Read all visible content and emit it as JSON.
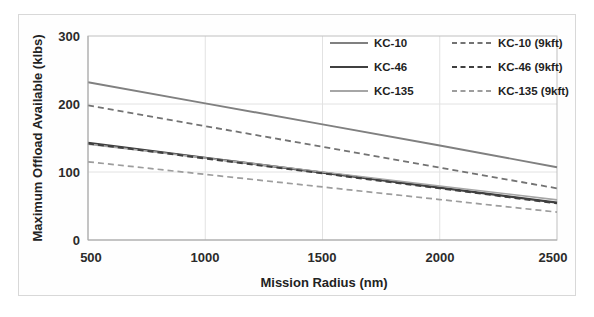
{
  "chart_data": {
    "type": "line",
    "title": "",
    "xlabel": "Mission Radius (nm)",
    "ylabel": "Maximum Offload Available (klbs)",
    "xlim": [
      500,
      2500
    ],
    "ylim": [
      0,
      300
    ],
    "xticks": [
      500,
      1000,
      1500,
      2000,
      2500
    ],
    "yticks": [
      0,
      100,
      200,
      300
    ],
    "xtick_labels": [
      "500",
      "1000",
      "1500",
      "2000",
      "2500"
    ],
    "ytick_labels": [
      "0",
      "100",
      "200",
      "300"
    ],
    "grid": "horizontal-and-vertical-light",
    "legend_position": "upper-right-inside-two-columns",
    "x": [
      500,
      1000,
      1500,
      2000,
      2500
    ],
    "series": [
      {
        "name": "KC-10",
        "style": "solid",
        "color": "#808080",
        "width": 1.9,
        "values": [
          232,
          201,
          170,
          139,
          107
        ]
      },
      {
        "name": "KC-46",
        "style": "solid",
        "color": "#404040",
        "width": 2.2,
        "values": [
          143,
          121,
          99,
          77,
          55
        ]
      },
      {
        "name": "KC-135",
        "style": "solid",
        "color": "#a6a6a6",
        "width": 1.6,
        "values": [
          141,
          120.5,
          100,
          79.5,
          59
        ]
      },
      {
        "name": "KC-10 (9kft)",
        "style": "dashed",
        "color": "#737373",
        "width": 1.8,
        "values": [
          198,
          167.5,
          137,
          106.5,
          76
        ]
      },
      {
        "name": "KC-46 (9kft)",
        "style": "dashed",
        "color": "#3f3f3f",
        "width": 2.1,
        "values": [
          142,
          120,
          98,
          76,
          54
        ]
      },
      {
        "name": "KC-135 (9kft)",
        "style": "dashed",
        "color": "#9d9d9d",
        "width": 1.7,
        "values": [
          115,
          96.5,
          78,
          59.5,
          41
        ]
      }
    ]
  },
  "legend": {
    "column_one": [
      {
        "label": "KC-10",
        "style": "solid",
        "color": "#808080"
      },
      {
        "label": "KC-46",
        "style": "solid",
        "color": "#404040"
      },
      {
        "label": "KC-135",
        "style": "solid",
        "color": "#a6a6a6"
      }
    ],
    "column_two": [
      {
        "label": "KC-10 (9kft)",
        "style": "dashed",
        "color": "#737373"
      },
      {
        "label": "KC-46 (9kft)",
        "style": "dashed",
        "color": "#3f3f3f"
      },
      {
        "label": "KC-135 (9kft)",
        "style": "dashed",
        "color": "#9d9d9d"
      }
    ]
  },
  "axes": {
    "x_title": "Mission Radius (nm)",
    "y_title": "Maximum Offload Available (klbs)",
    "x_tick_0": "500",
    "x_tick_1": "1000",
    "x_tick_2": "1500",
    "x_tick_3": "2000",
    "x_tick_4": "2500",
    "y_tick_0": "0",
    "y_tick_1": "100",
    "y_tick_2": "200",
    "y_tick_3": "300"
  },
  "colors": {
    "background": "#ffffff",
    "frame": "#d8d8d8",
    "gridline": "#e2e2e2",
    "axis": "#a9a9a9",
    "text": "#222222"
  }
}
